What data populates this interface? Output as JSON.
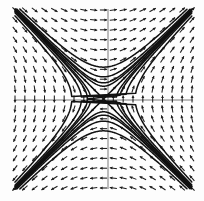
{
  "figure": {
    "kind": "phase-portrait",
    "title": "",
    "background_color": "#fdfdfd",
    "axis_color": "#6b6b6b",
    "arrow_color": "#1c1c1c",
    "trajectory_color": "#111111"
  },
  "chart_data": {
    "type": "scatter",
    "title": "",
    "subtitle": "",
    "xlabel": "",
    "ylabel": "",
    "grid": false,
    "legend": null,
    "annotations": [],
    "xlim": [
      -2.2,
      2.2
    ],
    "ylim": [
      -2.2,
      2.2
    ],
    "xticks": [],
    "yticks": [],
    "plot_box_px": {
      "left": 15,
      "top": 10,
      "right": 192,
      "bottom": 188
    },
    "origin_px": {
      "x": 108,
      "y": 100
    },
    "axes": [
      {
        "name": "x-axis",
        "orientation": "horizontal",
        "at_value": 0
      },
      {
        "name": "y-axis",
        "orientation": "vertical",
        "at_value": 0
      }
    ],
    "vector_field": {
      "description": "direction field of a planar linear-like system with a saddle/node equilibrium at the origin",
      "equilibrium": [
        0,
        0
      ],
      "grid_nx": 19,
      "grid_ny": 19,
      "glyph_length_px": 7.2,
      "model": {
        "dx_coeff": [
          0.0,
          1.0
        ],
        "dy_coeff": [
          1.0,
          0.0
        ],
        "note": "dx/dt = y, dy/dt = x"
      }
    },
    "trajectories": [
      {
        "name": "separatrix-stable",
        "branch": "upper-left-to-lower-right",
        "k": -1.0,
        "type": "separatrix"
      },
      {
        "name": "separatrix-unstable",
        "branch": "lower-left-to-upper-right",
        "k": 1.0,
        "type": "separatrix"
      },
      {
        "name": "orbit-a",
        "c": 0.1,
        "quadrant": "upper-left"
      },
      {
        "name": "orbit-b",
        "c": 0.3,
        "quadrant": "upper-left"
      },
      {
        "name": "orbit-c",
        "c": 0.62,
        "quadrant": "upper-left"
      },
      {
        "name": "orbit-d",
        "c": -0.1,
        "quadrant": "lower-right"
      },
      {
        "name": "orbit-e",
        "c": -0.3,
        "quadrant": "lower-right"
      },
      {
        "name": "orbit-f",
        "c": -0.62,
        "quadrant": "lower-right"
      },
      {
        "name": "orbit-g",
        "c": 0.16,
        "quadrant": "upper-right"
      },
      {
        "name": "orbit-h",
        "c": -0.16,
        "quadrant": "lower-left"
      }
    ]
  }
}
